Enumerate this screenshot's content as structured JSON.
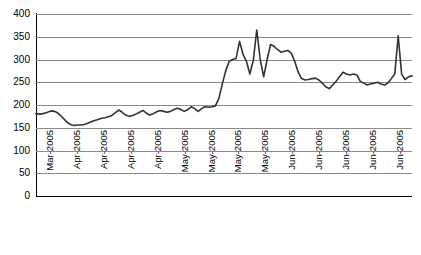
{
  "chart_data": {
    "type": "line",
    "title": "",
    "subtitle": "",
    "xlabel": "",
    "ylabel": "",
    "ylim": [
      0,
      400
    ],
    "ytick_step": 50,
    "ytick_labels": [
      "400",
      "350",
      "300",
      "250",
      "200",
      "150",
      "100",
      "50",
      "0"
    ],
    "ytick_values": [
      400,
      350,
      300,
      250,
      200,
      150,
      100,
      50,
      0
    ],
    "grid": true,
    "grid_axis": "y",
    "legend": false,
    "legend_position": "none",
    "line_color": "#333333",
    "gridline_color": "#8a8a8a",
    "axis_color": "#000000",
    "background_color": "#ffffff",
    "xtick_labels": [
      "Mar-2005",
      "Apr-2005",
      "Apr-2005",
      "Apr-2005",
      "Apr-2005",
      "May-2005",
      "May-2005",
      "May-2005",
      "May-2005",
      "Jun-2005",
      "Jun-2005",
      "Jun-2005",
      "Jun-2005",
      "Jun-2005"
    ],
    "xtick_count": 14,
    "series": [
      {
        "name": "series-1",
        "color": "#333333",
        "values": [
          181,
          180,
          181,
          183,
          186,
          187,
          184,
          178,
          170,
          162,
          157,
          155,
          156,
          156,
          157,
          160,
          163,
          166,
          168,
          171,
          172,
          174,
          177,
          183,
          189,
          184,
          178,
          175,
          177,
          180,
          184,
          188,
          182,
          178,
          181,
          185,
          188,
          186,
          184,
          186,
          190,
          193,
          190,
          186,
          190,
          196,
          192,
          186,
          192,
          196,
          195,
          196,
          198,
          214,
          246,
          275,
          296,
          300,
          302,
          340,
          312,
          296,
          268,
          298,
          365,
          300,
          262,
          300,
          333,
          329,
          322,
          316,
          318,
          320,
          314,
          296,
          272,
          258,
          255,
          256,
          258,
          259,
          255,
          248,
          240,
          236,
          244,
          252,
          262,
          272,
          268,
          266,
          268,
          266,
          252,
          248,
          244,
          246,
          248,
          250,
          246,
          244,
          248,
          258,
          268,
          352,
          268,
          256,
          262,
          264
        ]
      }
    ]
  }
}
